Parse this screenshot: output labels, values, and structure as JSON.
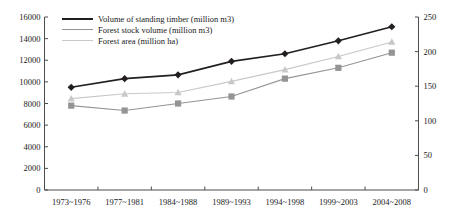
{
  "chart_data": {
    "type": "line",
    "title": "",
    "xlabel": "",
    "ylabel": "",
    "categories": [
      "1973~1976",
      "1977~1981",
      "1984~1988",
      "1989~1993",
      "1994~1998",
      "1999~2003",
      "2004~2008"
    ],
    "series": [
      {
        "name": "Volume of standing timber (million m3)",
        "axis": "left",
        "marker": "diamond",
        "color": "#231f20",
        "values": [
          9500,
          10300,
          10650,
          11900,
          12600,
          13800,
          15100
        ]
      },
      {
        "name": "Forest stock volume (million m3)",
        "axis": "left",
        "marker": "square",
        "color": "#949494",
        "values": [
          7800,
          7350,
          8000,
          8650,
          10300,
          11300,
          12700
        ]
      },
      {
        "name": "Forest area (million ha)",
        "axis": "right",
        "marker": "triangle",
        "color": "#c8c8c8",
        "values": [
          132,
          139,
          141,
          157,
          174,
          193,
          214
        ]
      }
    ],
    "y_left": {
      "min": 0,
      "max": 16000,
      "step": 2000,
      "ticks": [
        "0",
        "2000",
        "4000",
        "6000",
        "8000",
        "10000",
        "12000",
        "14000",
        "16000"
      ]
    },
    "y_right": {
      "min": 0,
      "max": 250,
      "step": 50,
      "ticks": [
        "0",
        "50",
        "100",
        "150",
        "200",
        "250"
      ]
    },
    "grid": false,
    "legend_position": "top-left",
    "axis_color": "#4d4d4d"
  }
}
